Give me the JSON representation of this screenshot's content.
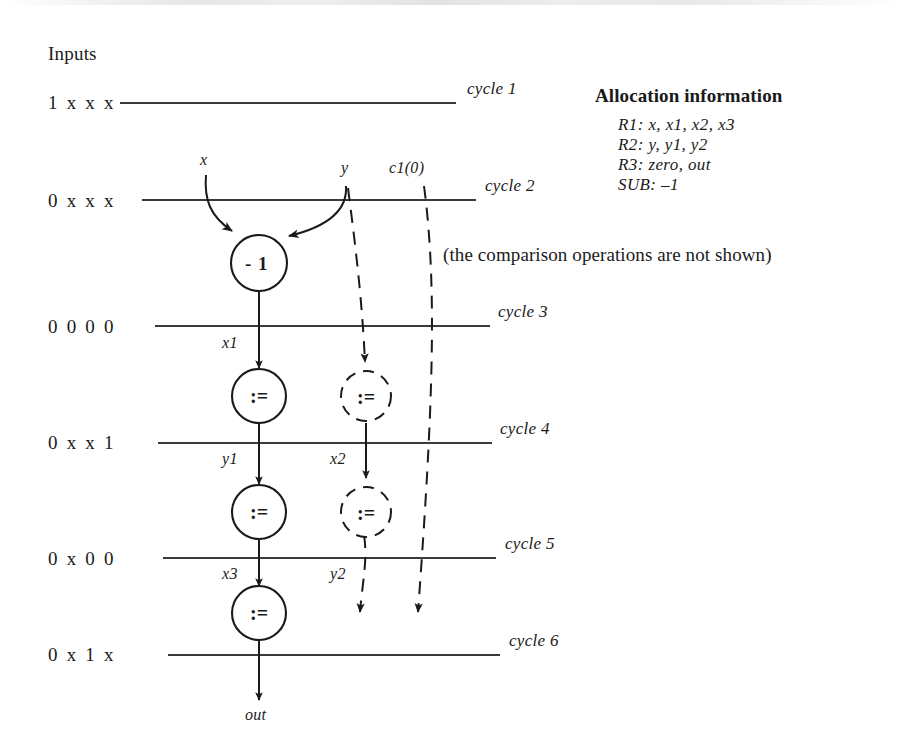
{
  "page": {
    "inputs_header": "Inputs",
    "note": "(the comparison operations are not shown)"
  },
  "inputs": [
    {
      "pattern": "1 x x x",
      "cycle": "cycle 1"
    },
    {
      "pattern": "0 x x x",
      "cycle": "cycle 2"
    },
    {
      "pattern": "0 0 0 0",
      "cycle": "cycle 3"
    },
    {
      "pattern": "0 x x 1",
      "cycle": "cycle 4"
    },
    {
      "pattern": "0 x 0 0",
      "cycle": "cycle 5"
    },
    {
      "pattern": "0 x 1 x",
      "cycle": "cycle 6"
    }
  ],
  "allocation": {
    "title": "Allocation information",
    "lines": [
      "R1: x, x1, x2, x3",
      "R2: y, y1, y2",
      "R3: zero, out",
      "SUB: –1"
    ]
  },
  "signals": {
    "x": "x",
    "y": "y",
    "c1": "c1(0)",
    "x1": "x1",
    "y1": "y1",
    "x2": "x2",
    "x3": "x3",
    "y2": "y2",
    "out": "out"
  },
  "nodes": [
    {
      "id": "sub",
      "label": "- 1",
      "style": "solid"
    },
    {
      "id": "assign1-solid",
      "label": ":=",
      "style": "solid"
    },
    {
      "id": "assign1-dashed",
      "label": ":=",
      "style": "dashed"
    },
    {
      "id": "assign2-solid",
      "label": ":=",
      "style": "solid"
    },
    {
      "id": "assign2-dashed",
      "label": ":=",
      "style": "dashed"
    },
    {
      "id": "assign3-solid",
      "label": ":=",
      "style": "solid"
    }
  ],
  "colors": {
    "ink": "#1a1a1a",
    "line": "#3a3a3a",
    "background": "#ffffff"
  }
}
